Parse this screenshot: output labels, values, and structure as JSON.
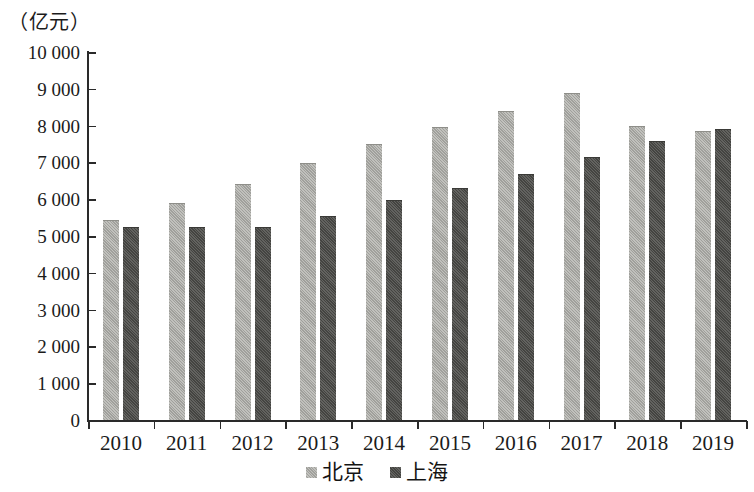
{
  "axis": {
    "unit_label": "（亿元）",
    "y_ticks": [
      "10 000",
      "9 000",
      "8 000",
      "7 000",
      "6 000",
      "5 000",
      "4 000",
      "3 000",
      "2 000",
      "1 000",
      "0"
    ]
  },
  "legend": {
    "items": [
      {
        "label": "北京",
        "color": "#a9a9a4",
        "key": "beijing"
      },
      {
        "label": "上海",
        "color": "#4d4d4a",
        "key": "shanghai"
      }
    ]
  },
  "chart_data": {
    "type": "bar",
    "title": "",
    "subtitle": "",
    "xlabel": "",
    "ylabel": "（亿元）",
    "ylim": [
      0,
      10000
    ],
    "ytick_values": [
      0,
      1000,
      2000,
      3000,
      4000,
      5000,
      6000,
      7000,
      8000,
      9000,
      10000
    ],
    "ytick_labels": [
      "0",
      "1 000",
      "2 000",
      "3 000",
      "4 000",
      "5 000",
      "6 000",
      "7 000",
      "8 000",
      "9 000",
      "10 000"
    ],
    "grid": false,
    "legend_position": "bottom",
    "categories": [
      "2010",
      "2011",
      "2012",
      "2013",
      "2014",
      "2015",
      "2016",
      "2017",
      "2018",
      "2019"
    ],
    "series": [
      {
        "name": "北京",
        "color": "#a9a9a4",
        "values": [
          5420,
          5870,
          6390,
          6960,
          7470,
          7930,
          8370,
          8870,
          7960,
          7820
        ]
      },
      {
        "name": "上海",
        "color": "#4d4d4a",
        "values": [
          5230,
          5220,
          5220,
          5530,
          5950,
          6280,
          6650,
          7130,
          7560,
          7890
        ]
      }
    ]
  }
}
